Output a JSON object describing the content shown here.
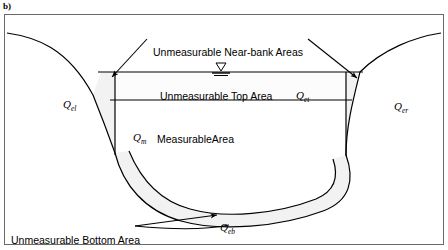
{
  "figure": {
    "panel_label": "b)",
    "caption_labels": {
      "near_bank": "Unmeasurable Near-bank Areas",
      "top_area": "Unmeasurable Top Area",
      "measurable_area": "MeasurableArea",
      "bottom_area": "Unmeasurable Bottom Area"
    },
    "symbols": {
      "q_el": "Q",
      "q_el_sub": "el",
      "q_er": "Q",
      "q_er_sub": "er",
      "q_et": "Q",
      "q_et_sub": "et",
      "q_m": "Q",
      "q_m_sub": "m",
      "q_eb": "Q",
      "q_eb_sub": "eb"
    },
    "water_surface_symbol": "water-surface-triangle",
    "colors": {
      "line": "#000000",
      "frame": "#6a6a6a",
      "shade": "#f2f2f2",
      "background": "#ffffff"
    }
  }
}
